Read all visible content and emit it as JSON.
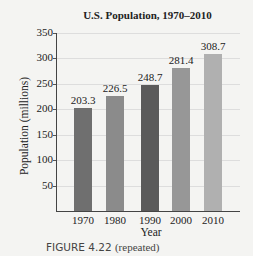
{
  "chart_data": {
    "type": "bar",
    "title": "U.S. Population, 1970–2010",
    "xlabel": "Year",
    "ylabel": "Population (millions)",
    "categories": [
      "1970",
      "1980",
      "1990",
      "2000",
      "2010"
    ],
    "values": [
      203.3,
      226.5,
      248.7,
      281.4,
      308.7
    ],
    "value_labels": [
      "203.3",
      "226.5",
      "248.7",
      "281.4",
      "308.7"
    ],
    "yticks": [
      "50",
      "100",
      "150",
      "200",
      "250",
      "300",
      "350"
    ],
    "ylim": [
      0,
      350
    ],
    "grid": true,
    "bar_colors": [
      "#6f6f6f",
      "#8b8b8b",
      "#5a5a5a",
      "#979797",
      "#b0b0b0"
    ]
  },
  "caption": {
    "label": "FIGURE 4.22",
    "note": "(repeated)"
  }
}
